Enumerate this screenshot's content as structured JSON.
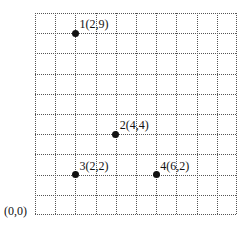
{
  "diagram": {
    "type": "coordinate-grid",
    "grid": {
      "cols": 10,
      "rows": 10,
      "line_style": "dotted",
      "line_color": "#555555"
    },
    "origin_label": "(0,0)",
    "points": [
      {
        "id": 1,
        "x": 2,
        "y": 9,
        "label": "1(2,9)"
      },
      {
        "id": 2,
        "x": 4,
        "y": 4,
        "label": "2(4,4)"
      },
      {
        "id": 3,
        "x": 2,
        "y": 2,
        "label": "3(2,2)"
      },
      {
        "id": 4,
        "x": 6,
        "y": 2,
        "label": "4(6,2)"
      }
    ]
  }
}
